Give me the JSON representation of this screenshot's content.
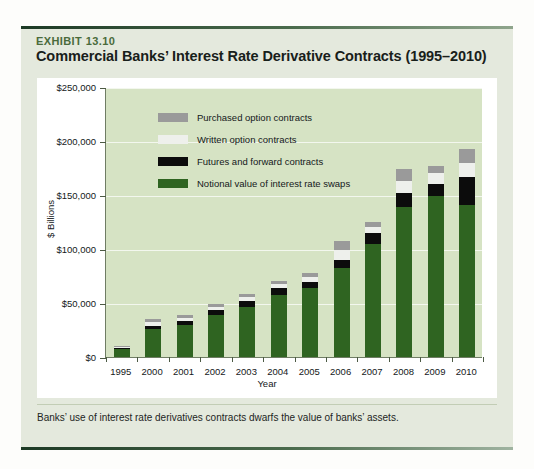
{
  "exhibit": {
    "label": "EXHIBIT 13.10",
    "title": "Commercial Banks’ Interest Rate Derivative Contracts (1995–2010)",
    "caption": "Banks’ use of interest rate derivatives contracts dwarfs the value of banks’ assets."
  },
  "colors": {
    "card_bg": "#e4e9dd",
    "plot_bg": "#d6e3c4",
    "chart_bg": "#ffffff",
    "swaps": "#2f6421",
    "futures": "#0c0c0c",
    "written": "#eef0ec",
    "purchased": "#9a9a9a",
    "axis": "#4c5a44",
    "gridline": "#f3f7ee",
    "label_accent": "#4a6b3b"
  },
  "chart_data": {
    "type": "bar",
    "title": "Commercial Banks’ Interest Rate Derivative Contracts (1995–2010)",
    "subtitle": "",
    "xlabel": "Year",
    "ylabel": "$ Billions",
    "ylim": [
      0,
      250000
    ],
    "ytick_values": [
      0,
      50000,
      100000,
      150000,
      200000,
      250000
    ],
    "ytick_labels": [
      "$0",
      "$50,000",
      "$100,000",
      "$150,000",
      "$200,000",
      "$250,000"
    ],
    "grid": true,
    "stacked": true,
    "legend_position": "inside-top-left",
    "categories": [
      "1995",
      "2000",
      "2001",
      "2002",
      "2003",
      "2004",
      "2005",
      "2006",
      "2007",
      "2008",
      "2009",
      "2010"
    ],
    "series": [
      {
        "name": "Notional value of interest rate swaps",
        "color": "#2f6421",
        "values": [
          7000,
          26000,
          30000,
          39000,
          46000,
          57000,
          64000,
          82000,
          105000,
          139000,
          149000,
          141000
        ]
      },
      {
        "name": "Futures and forward contracts",
        "color": "#0c0c0c",
        "values": [
          1500,
          3000,
          3000,
          4500,
          6000,
          6500,
          5500,
          8000,
          9500,
          13000,
          11000,
          26000
        ]
      },
      {
        "name": "Written option contracts",
        "color": "#eef0ec",
        "values": [
          1000,
          3000,
          3000,
          3000,
          3500,
          4000,
          4500,
          9000,
          6000,
          11000,
          10000,
          13000
        ]
      },
      {
        "name": "Purchased option contracts",
        "color": "#9a9a9a",
        "values": [
          900,
          3000,
          3000,
          3000,
          3000,
          3000,
          4000,
          8000,
          5000,
          11000,
          7000,
          13000
        ]
      }
    ],
    "totals": [
      10400,
      35000,
      39000,
      49500,
      58500,
      70500,
      78000,
      107000,
      125500,
      174000,
      177000,
      193000
    ]
  }
}
